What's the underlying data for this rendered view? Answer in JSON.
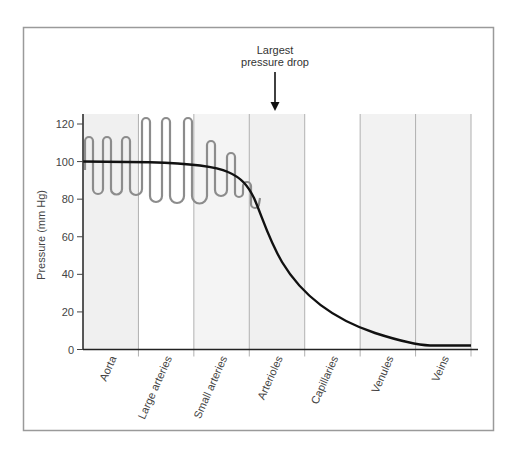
{
  "chart_data": {
    "type": "line",
    "title": "",
    "xlabel": "",
    "ylabel": "Pressure (mm Hg)",
    "ylim": [
      0,
      120
    ],
    "yticks": [
      0,
      20,
      40,
      60,
      80,
      100,
      120
    ],
    "grid": "vertical column dividers",
    "legend": null,
    "categories": [
      "Aorta",
      "Large arteries",
      "Small arteries",
      "Arterioles",
      "Capillaries",
      "Venules",
      "Veins"
    ],
    "column_shading": [
      "#f0f0f0",
      "#ffffff",
      "#f4f4f4",
      "#f0f0f0",
      "#ffffff",
      "#f2f2f2",
      "#f2f2f2"
    ],
    "series": [
      {
        "name": "Mean pressure",
        "color": "#111111",
        "x": [
          "Aorta",
          "Large arteries",
          "Small arteries",
          "Arterioles",
          "Capillaries",
          "Venules",
          "Veins"
        ],
        "values": [
          100,
          99,
          93,
          55,
          25,
          8,
          2
        ]
      },
      {
        "name": "Pulsatile pressure (systolic/diastolic)",
        "color": "#888888",
        "segments": [
          {
            "category": "Aorta",
            "systolic": 112,
            "diastolic": 84
          },
          {
            "category": "Large arteries",
            "systolic": 122,
            "diastolic": 80
          },
          {
            "category": "Small arteries",
            "systolic": 110,
            "diastolic": 82
          },
          {
            "category": "Small arteries (distal)",
            "systolic": 104,
            "diastolic": 81
          },
          {
            "category": "Arterioles (entry)",
            "systolic": 89,
            "diastolic": 75
          }
        ]
      }
    ],
    "annotations": [
      {
        "text_line1": "Largest",
        "text_line2": "pressure drop",
        "points_to": "Arterioles",
        "type": "down-arrow"
      }
    ]
  },
  "annotation": {
    "line1": "Largest",
    "line2": "pressure drop"
  },
  "axis": {
    "ylabel": "Pressure (mm Hg)",
    "yticks": [
      "0",
      "20",
      "40",
      "60",
      "80",
      "100",
      "120"
    ],
    "categories": [
      "Aorta",
      "Large arteries",
      "Small arteries",
      "Arterioles",
      "Capillaries",
      "Venules",
      "Veins"
    ]
  }
}
